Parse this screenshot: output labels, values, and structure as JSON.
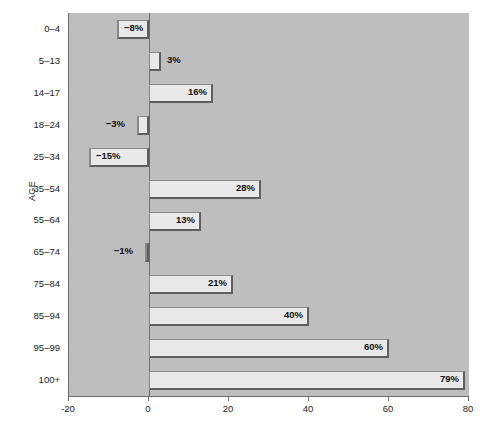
{
  "chart_data": {
    "type": "bar",
    "orientation": "horizontal",
    "title": "",
    "subtitle": "",
    "xlabel": "",
    "ylabel": "AGE",
    "categories": [
      "0–4",
      "5–13",
      "14–17",
      "18–24",
      "25–34",
      "35–54",
      "55–64",
      "65–74",
      "75–84",
      "85–94",
      "95–99",
      "100+"
    ],
    "values": [
      -8,
      3,
      16,
      -3,
      -15,
      28,
      13,
      -1,
      21,
      40,
      60,
      79
    ],
    "data_labels": [
      "−8%",
      "3%",
      "16%",
      "−3%",
      "−15%",
      "28%",
      "13%",
      "−1%",
      "21%",
      "40%",
      "60%",
      "79%"
    ],
    "label_placement": [
      "inside",
      "outside",
      "inside",
      "outside",
      "inside",
      "inside",
      "inside",
      "outside",
      "inside",
      "inside",
      "inside",
      "inside"
    ],
    "xlim": [
      -20,
      80
    ],
    "ylim": null,
    "xticks": [
      -20,
      0,
      20,
      40,
      60,
      80
    ],
    "xtick_labels": [
      "-20",
      "0",
      "20",
      "40",
      "60",
      "80"
    ],
    "grid": false,
    "legend": null,
    "legend_position": "none",
    "units": "percent",
    "colors": {
      "plot_background": "#bebebe",
      "page_background": "#ffffff",
      "bar_fill": "#e9e9e9",
      "bar_shadow": "#5f5f5f",
      "bar_border": "#8a8a8a",
      "axis": "#6d6d6d",
      "text": "#1a1a1a"
    }
  }
}
